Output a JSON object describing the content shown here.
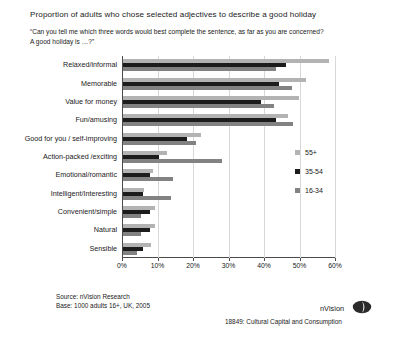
{
  "chart_data": {
    "type": "bar",
    "orientation": "horizontal",
    "title": "Proportion of adults who chose selected adjectives to describe a good holiday",
    "subtitle_line1": "“Can you tell me which three words would best complete the sentence, as far as you are concerned?",
    "subtitle_line2": "A good holiday is …?”",
    "xlabel": "",
    "ylabel": "",
    "xlim": [
      0,
      60
    ],
    "xticks": [
      0,
      10,
      20,
      30,
      40,
      50,
      60
    ],
    "xtick_labels": [
      "0%",
      "10%",
      "20%",
      "30%",
      "40%",
      "50%",
      "60%"
    ],
    "grid": true,
    "legend_position": "right",
    "categories": [
      "Relaxed/informal",
      "Memorable",
      "Value for money",
      "Fun/amusing",
      "Good for you / self-improving",
      "Action-packed /exciting",
      "Emotional/romantic",
      "Intelligent/Interesting",
      "Convenient/simple",
      "Natural",
      "Sensible"
    ],
    "series": [
      {
        "name": "55+",
        "color": "#b3b3b3",
        "values": [
          58.0,
          51.5,
          49.5,
          46.5,
          22.0,
          12.5,
          8.5,
          6.0,
          9.0,
          9.0,
          8.0
        ]
      },
      {
        "name": "35-54",
        "color": "#1c1c1c",
        "values": [
          46.0,
          44.0,
          39.0,
          43.0,
          18.0,
          10.0,
          7.5,
          5.5,
          7.5,
          7.5,
          5.5
        ]
      },
      {
        "name": "16-34",
        "color": "#828282",
        "values": [
          43.0,
          47.5,
          42.5,
          48.0,
          20.5,
          28.0,
          14.0,
          13.5,
          5.0,
          5.0,
          4.0
        ]
      }
    ]
  },
  "legend": {
    "items": [
      {
        "label": "55+",
        "color": "#b3b3b3"
      },
      {
        "label": "35-54",
        "color": "#1c1c1c"
      },
      {
        "label": "16-34",
        "color": "#828282"
      }
    ]
  },
  "footer": {
    "source": "Source: nVision Research",
    "base": "Base: 1000 adults 16+, UK, 2005",
    "reference": "18849: Cultural Capital and Consumption",
    "brand": "nVision"
  }
}
